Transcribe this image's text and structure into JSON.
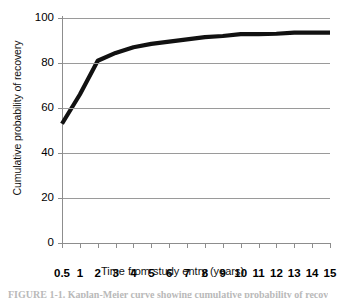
{
  "chart_data": {
    "type": "line",
    "title": "",
    "xlabel": "Time from study entry (years)",
    "ylabel": "Cumulative probability of recovery",
    "xlim": [
      0.5,
      15
    ],
    "ylim": [
      0,
      100
    ],
    "grid": true,
    "legend": "none",
    "x_tick_labels": [
      "0.5",
      "1",
      "2",
      "3",
      "4",
      "5",
      "6",
      "7",
      "8",
      "9",
      "10",
      "11",
      "12",
      "13",
      "14",
      "15"
    ],
    "y_tick_labels": [
      "0",
      "20",
      "40",
      "60",
      "80",
      "100"
    ],
    "y_ticks": [
      0,
      20,
      40,
      60,
      80,
      100
    ],
    "series": [
      {
        "name": "Cumulative probability of recovery",
        "color": "#111111",
        "x": [
          0.5,
          1,
          2,
          3,
          4,
          5,
          6,
          7,
          8,
          9,
          10,
          11,
          12,
          13,
          14,
          15
        ],
        "values": [
          53,
          66,
          81,
          84.5,
          87,
          88.5,
          89.5,
          90.5,
          91.5,
          92,
          92.8,
          92.8,
          93,
          93.5,
          93.5,
          93.5
        ]
      }
    ]
  },
  "caption": {
    "text": "FIGURE 1-1. Kaplan-Meier curve showing cumulative probability of recovery"
  }
}
